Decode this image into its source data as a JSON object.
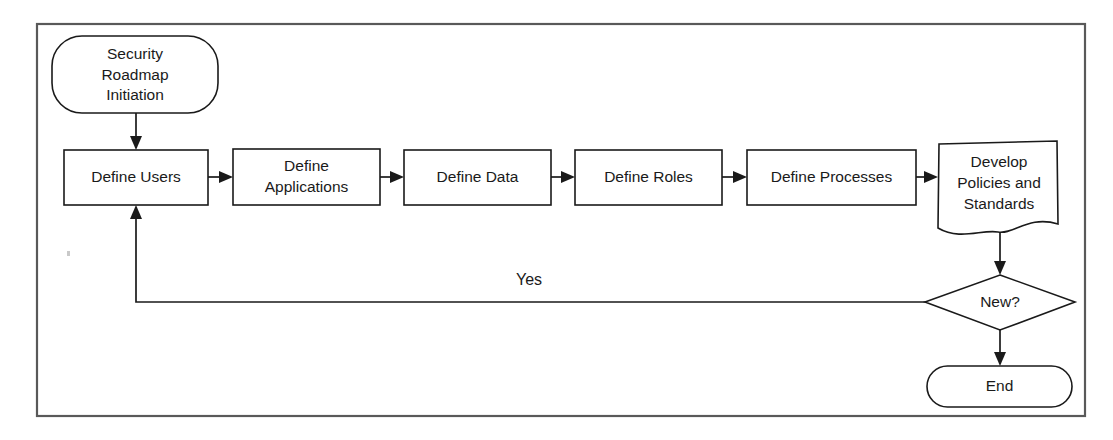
{
  "diagram": {
    "background_color": "#ffffff",
    "shape_stroke_color": "#1a1a1a",
    "frame_color": "#595959",
    "text_color": "#1a1a1a",
    "nodes": {
      "start": {
        "label_line1": "Security",
        "label_line2": "Roadmap",
        "label_line3": "Initiation",
        "shape": "rounded-terminator"
      },
      "define_users": {
        "label": "Define Users",
        "shape": "process-rectangle"
      },
      "define_applications": {
        "label_line1": "Define",
        "label_line2": "Applications",
        "shape": "process-rectangle"
      },
      "define_data": {
        "label": "Define Data",
        "shape": "process-rectangle"
      },
      "define_roles": {
        "label": "Define Roles",
        "shape": "process-rectangle"
      },
      "define_processes": {
        "label": "Define Processes",
        "shape": "process-rectangle"
      },
      "develop_policies": {
        "label_line1": "Develop",
        "label_line2": "Policies and",
        "label_line3": "Standards",
        "shape": "document"
      },
      "decision_new": {
        "label": "New?",
        "shape": "diamond"
      },
      "end": {
        "label": "End",
        "shape": "rounded-terminator"
      }
    },
    "edges": {
      "start_to_define_users": {
        "label": ""
      },
      "users_to_applications": {
        "label": ""
      },
      "applications_to_data": {
        "label": ""
      },
      "data_to_roles": {
        "label": ""
      },
      "roles_to_processes": {
        "label": ""
      },
      "processes_to_policies": {
        "label": ""
      },
      "policies_to_decision": {
        "label": ""
      },
      "decision_to_define_users": {
        "label": "Yes"
      },
      "decision_to_end": {
        "label": ""
      }
    }
  }
}
